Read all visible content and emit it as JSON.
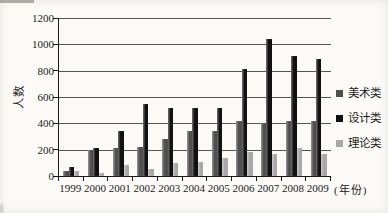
{
  "chart_data": {
    "type": "bar",
    "title": "",
    "ylabel": "人数",
    "xlabel_suffix": "(年份)",
    "categories": [
      "1999",
      "2000",
      "2001",
      "2002",
      "2003",
      "2004",
      "2005",
      "2006",
      "2007",
      "2008",
      "2009"
    ],
    "series": [
      {
        "name": "美术类",
        "color": "#4f4f4f",
        "values": [
          40,
          200,
          215,
          220,
          280,
          345,
          345,
          420,
          405,
          420,
          415
        ]
      },
      {
        "name": "设计类",
        "color": "#111111",
        "values": [
          70,
          215,
          345,
          550,
          515,
          515,
          515,
          810,
          1040,
          915,
          890
        ]
      },
      {
        "name": "理论类",
        "color": "#a8a8a8",
        "values": [
          35,
          25,
          85,
          55,
          100,
          110,
          140,
          180,
          170,
          215,
          165
        ]
      }
    ],
    "ylim": [
      0,
      1200
    ],
    "yticks": [
      0,
      200,
      400,
      600,
      800,
      1000,
      1200
    ],
    "grid": true,
    "legend_position": "right",
    "colors": {
      "grid": "#555555",
      "axis": "#1a1a1a",
      "text": "#1c1c1c",
      "background": "#fbfaf7"
    }
  }
}
